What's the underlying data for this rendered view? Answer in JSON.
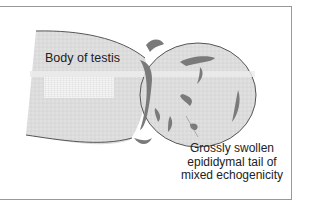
{
  "diagram": {
    "labels": {
      "body_of_testis": "Body of testis",
      "tail_line1": "Grossly swollen",
      "tail_line2": "epididymal tail of",
      "tail_line3": "mixed echogenicity"
    },
    "colors": {
      "testis_fill": "#dcdcdc",
      "epididymis_fill": "#e2e2e2",
      "lesion": "#7a7a7a",
      "outline": "#555555",
      "frame": "#999999"
    }
  }
}
